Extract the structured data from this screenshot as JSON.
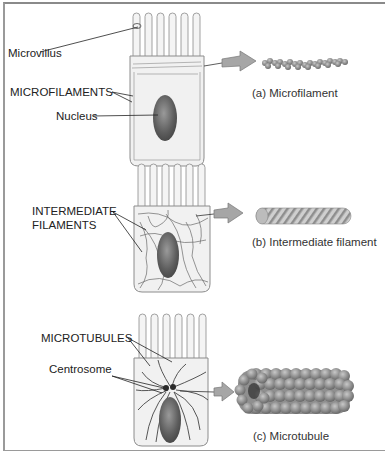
{
  "panels": [
    {
      "id": "a",
      "labels": {
        "microvillus": "Microvillus",
        "microfilaments": "MICROFILAMENTS",
        "nucleus": "Nucleus"
      },
      "caption": "(a) Microfilament"
    },
    {
      "id": "b",
      "labels": {
        "intermediate_line1": "INTERMEDIATE",
        "intermediate_line2": "FILAMENTS"
      },
      "caption": "(b) Intermediate filament"
    },
    {
      "id": "c",
      "labels": {
        "microtubules": "MICROTUBULES",
        "centrosome": "Centrosome"
      },
      "caption": "(c) Microtubule"
    }
  ],
  "colors": {
    "cell_fill": "#f1f1f1",
    "cell_outline": "#8c8c8c",
    "nucleus": "#6e6e6e",
    "arrow": "#a6a6a6",
    "filament": "#5a5a5a"
  }
}
